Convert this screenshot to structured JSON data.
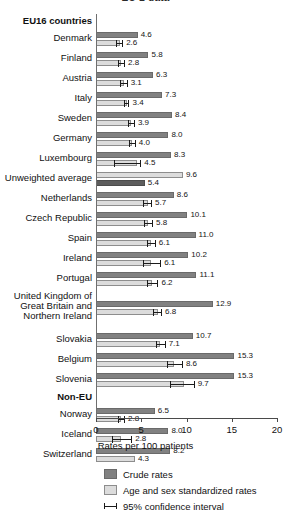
{
  "chart_data": {
    "type": "bar",
    "orientation": "horizontal",
    "title": "EU-2 data",
    "xlabel": "Rates per 100 patients",
    "ylabel": "",
    "xlim": [
      0,
      20
    ],
    "xticks": [
      0,
      5,
      10,
      15,
      20
    ],
    "grid": false,
    "legend_position": "bottom",
    "colors": {
      "crude": "#818181",
      "standardized": "#dcdcdc",
      "average_crude": "#5d5d5d",
      "ci": "#1b1b1b"
    },
    "series": [
      {
        "name": "Crude rates",
        "key": "crude"
      },
      {
        "name": "Age and sex standardized rates",
        "key": "standardized"
      },
      {
        "name": "95% confidence interval",
        "key": "ci"
      }
    ],
    "groups": [
      {
        "label": "EU16 countries",
        "type": "header"
      },
      {
        "label": "Denmark",
        "type": "country",
        "crude": 4.6,
        "standardized": 2.6,
        "ci_low": 2.2,
        "ci_high": 3.0
      },
      {
        "label": "Finland",
        "type": "country",
        "crude": 5.8,
        "standardized": 2.8,
        "ci_low": 2.4,
        "ci_high": 3.2
      },
      {
        "label": "Austria",
        "type": "country",
        "crude": 6.3,
        "standardized": 3.1,
        "ci_low": 2.7,
        "ci_high": 3.5
      },
      {
        "label": "Italy",
        "type": "country",
        "crude": 7.3,
        "standardized": 3.4,
        "ci_low": 3.1,
        "ci_high": 3.7
      },
      {
        "label": "Sweden",
        "type": "country",
        "crude": 8.4,
        "standardized": 3.9,
        "ci_low": 3.5,
        "ci_high": 4.3
      },
      {
        "label": "Germany",
        "type": "country",
        "crude": 8.0,
        "standardized": 4.0,
        "ci_low": 3.6,
        "ci_high": 4.4
      },
      {
        "label": "Luxembourg",
        "type": "country",
        "crude": 8.3,
        "standardized": 4.5,
        "ci_low": 2.0,
        "ci_high": 5.0
      },
      {
        "label": "Unweighted average",
        "type": "average",
        "crude": 5.4,
        "standardized": 9.6
      },
      {
        "label": "Netherlands",
        "type": "country",
        "crude": 8.6,
        "standardized": 5.7,
        "ci_low": 5.2,
        "ci_high": 6.2
      },
      {
        "label": "Czech Republic",
        "type": "country",
        "crude": 10.1,
        "standardized": 5.8,
        "ci_low": 5.3,
        "ci_high": 6.3
      },
      {
        "label": "Spain",
        "type": "country",
        "crude": 11.0,
        "standardized": 6.1,
        "ci_low": 5.6,
        "ci_high": 6.6
      },
      {
        "label": "Ireland",
        "type": "country",
        "crude": 10.2,
        "standardized": 6.1,
        "ci_low": 5.2,
        "ci_high": 7.2
      },
      {
        "label": "Portugal",
        "type": "country",
        "crude": 11.1,
        "standardized": 6.2,
        "ci_low": 5.6,
        "ci_high": 6.9
      },
      {
        "label": "United Kingdom of\nGreat Britain and\nNorthern Ireland",
        "type": "country-tall",
        "crude": 12.9,
        "standardized": 6.8,
        "ci_low": 6.3,
        "ci_high": 7.3
      },
      {
        "label": "Slovakia",
        "type": "country",
        "crude": 10.7,
        "standardized": 7.1,
        "ci_low": 6.6,
        "ci_high": 7.7
      },
      {
        "label": "Belgium",
        "type": "country",
        "crude": 15.3,
        "standardized": 8.6,
        "ci_low": 7.8,
        "ci_high": 9.6
      },
      {
        "label": "Slovenia",
        "type": "country",
        "crude": 15.3,
        "standardized": 9.7,
        "ci_low": 8.2,
        "ci_high": 10.9
      },
      {
        "label": "Non-EU",
        "type": "header"
      },
      {
        "label": "Norway",
        "type": "country",
        "crude": 6.5,
        "standardized": 2.8,
        "ci_low": 2.4,
        "ci_high": 3.2
      },
      {
        "label": "Iceland",
        "type": "country",
        "crude": 8.0,
        "standardized": 2.8,
        "ci_low": 1.8,
        "ci_high": 4.0
      },
      {
        "label": "Switzerland",
        "type": "country",
        "crude": 8.2,
        "standardized": 4.3
      }
    ]
  }
}
